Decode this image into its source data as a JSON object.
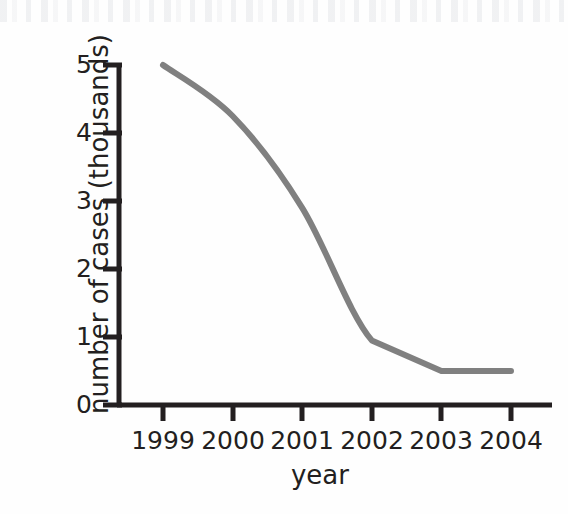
{
  "chart_data": {
    "type": "line",
    "title": "",
    "xlabel": "year",
    "ylabel": "number of cases (thousands)",
    "categories": [
      "1999",
      "2000",
      "2001",
      "2002",
      "2003",
      "2004"
    ],
    "x": [
      1999,
      2000,
      2001,
      2002,
      2003,
      2004
    ],
    "values": [
      5.0,
      4.25,
      2.9,
      0.95,
      0.5,
      0.5
    ],
    "series": [
      {
        "name": "number of cases",
        "values": [
          5.0,
          4.25,
          2.9,
          0.95,
          0.5,
          0.5
        ],
        "color": "#808080"
      }
    ],
    "xlim": [
      1999,
      2004
    ],
    "ylim": [
      0,
      5
    ],
    "yticks": [
      "0",
      "1",
      "2",
      "3",
      "4",
      "5"
    ],
    "ytick_values": [
      0,
      1,
      2,
      3,
      4,
      5
    ],
    "xticks": [
      "1999",
      "2000",
      "2001",
      "2002",
      "2003",
      "2004"
    ],
    "grid": false,
    "legend": false,
    "legend_position": "none",
    "smoothing": "curve between 1999 and 2002, straight segments after",
    "line_color": "#808080",
    "axis_color": "#231f20",
    "background_color": "#fefefe"
  },
  "axes": {
    "y_title": "number of cases (thousands)",
    "x_title": "year",
    "y_tick_labels": [
      "5",
      "4",
      "3",
      "2",
      "1",
      "0"
    ],
    "x_tick_labels": [
      "1999",
      "2000",
      "2001",
      "2002",
      "2003",
      "2004"
    ]
  }
}
